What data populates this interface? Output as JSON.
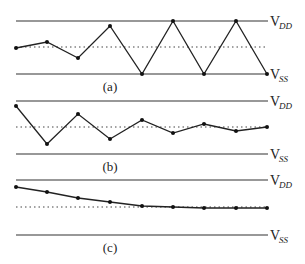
{
  "labels": {
    "vdd_main": "V",
    "vdd_sub": "DD",
    "vss_main": "V",
    "vss_sub": "SS"
  },
  "panels": [
    {
      "caption": "(a)",
      "description": "growing oscillation until rails",
      "vdd_y": 21,
      "vss_y": 74,
      "mid_y": 47,
      "points": [
        [
          16,
          48
        ],
        [
          47,
          42
        ],
        [
          78,
          58
        ],
        [
          110,
          26
        ],
        [
          142,
          74
        ],
        [
          173,
          21
        ],
        [
          204,
          74
        ],
        [
          236,
          21
        ],
        [
          267,
          74
        ]
      ]
    },
    {
      "caption": "(b)",
      "description": "damped oscillation",
      "vdd_y": 101,
      "vss_y": 154,
      "mid_y": 127,
      "points": [
        [
          16,
          106
        ],
        [
          47,
          144
        ],
        [
          78,
          114
        ],
        [
          110,
          139
        ],
        [
          142,
          120
        ],
        [
          173,
          133
        ],
        [
          204,
          124
        ],
        [
          236,
          131
        ],
        [
          267,
          127
        ]
      ]
    },
    {
      "caption": "(c)",
      "description": "monotonic settling",
      "vdd_y": 180,
      "vss_y": 235,
      "mid_y": 207,
      "points": [
        [
          16,
          187
        ],
        [
          47,
          192
        ],
        [
          78,
          198
        ],
        [
          110,
          202
        ],
        [
          142,
          206
        ],
        [
          173,
          207
        ],
        [
          204,
          208
        ],
        [
          236,
          208
        ],
        [
          267,
          208
        ]
      ]
    }
  ]
}
